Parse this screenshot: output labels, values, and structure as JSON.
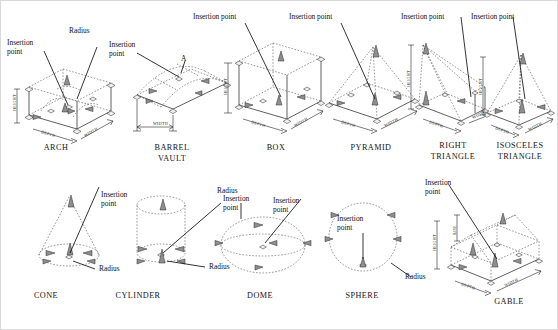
{
  "sheet": {
    "title": "AutoCAD Architectural Solid Primitives — Insertion Points, Radius and Grips",
    "label_insertion_point": "Insertion\npoint",
    "label_insertion_point_inline": "Insertion point",
    "label_radius": "Radius",
    "label_a": "A",
    "dim_height": "HEIGHT",
    "dim_width": "WIDTH",
    "dim_depth": "DEPTH",
    "dim_rise": "RISE",
    "colors": {
      "background": "#ffffff",
      "solid_line": "#2b2b2b",
      "hidden_line": "#555555",
      "grip_fill": "#efefef",
      "grip_fill_active": "#8f8f8f",
      "text": "#111111",
      "border": "#d8d8d8"
    }
  },
  "rows": [
    {
      "name": "top-row",
      "figures": [
        {
          "id": "arch",
          "caption": "ARCH",
          "callouts": [
            "Insertion\npoint",
            "Radius"
          ],
          "dimensions": [
            "HEIGHT",
            "WIDTH",
            "DEPTH"
          ]
        },
        {
          "id": "barrel-vault",
          "caption": "BARREL\nVAULT",
          "callouts": [
            "Insertion\npoint",
            "A"
          ],
          "dimensions": [
            "WIDTH"
          ]
        },
        {
          "id": "box",
          "caption": "BOX",
          "callouts": [
            "Insertion point"
          ],
          "dimensions": [
            "HEIGHT",
            "WIDTH",
            "DEPTH"
          ]
        },
        {
          "id": "pyramid",
          "caption": "PYRAMID",
          "callouts": [
            "Insertion point"
          ],
          "dimensions": [
            "WIDTH",
            "DEPTH"
          ]
        },
        {
          "id": "right-triangle",
          "caption": "RIGHT\nTRIANGLE",
          "callouts": [
            "Insertion point"
          ],
          "dimensions": [
            "HEIGHT",
            "WIDTH",
            "DEPTH"
          ]
        },
        {
          "id": "isosceles-triangle",
          "caption": "ISOSCELES\nTRIANGLE",
          "callouts": [
            "Insertion point"
          ],
          "dimensions": [
            "HEIGHT",
            "WIDTH",
            "DEPTH"
          ]
        }
      ]
    },
    {
      "name": "bottom-row",
      "figures": [
        {
          "id": "cone",
          "caption": "CONE",
          "callouts": [
            "Insertion\npoint",
            "Radius"
          ],
          "dimensions": []
        },
        {
          "id": "cylinder",
          "caption": "CYLINDER",
          "callouts": [
            "Insertion\npoint",
            "Radius"
          ],
          "dimensions": []
        },
        {
          "id": "dome",
          "caption": "DOME",
          "callouts": [
            "Insertion\npoint",
            "Radius"
          ],
          "dimensions": []
        },
        {
          "id": "sphere",
          "caption": "SPHERE",
          "callouts": [
            "Insertion\npoint",
            "Radius"
          ],
          "dimensions": []
        },
        {
          "id": "gable",
          "caption": "GABLE",
          "callouts": [
            "Insertion\npoint"
          ],
          "dimensions": [
            "HEIGHT",
            "WIDTH",
            "DEPTH",
            "RISE"
          ]
        }
      ]
    }
  ]
}
